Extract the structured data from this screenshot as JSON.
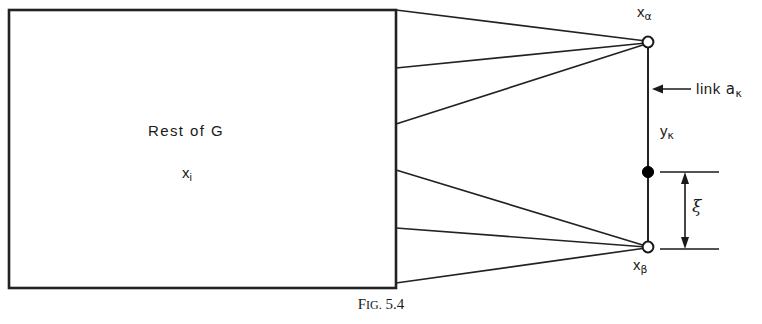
{
  "figure": {
    "caption_prefix": "F",
    "caption_small": "IG.",
    "caption_number": "5.4",
    "caption_full": "FIG. 5.4"
  },
  "box": {
    "label_main": "Rest of G",
    "label_node": "x",
    "label_node_sub": "i"
  },
  "nodes": [
    {
      "name": "x-alpha",
      "label_base": "x",
      "label_sub": "α",
      "style": "open-circle",
      "x": 648,
      "y": 42
    },
    {
      "name": "y-kappa",
      "label_base": "y",
      "label_sub": "κ",
      "style": "filled-circle",
      "x": 648,
      "y": 172
    },
    {
      "name": "x-beta",
      "label_base": "x",
      "label_sub": "β",
      "style": "open-circle",
      "x": 648,
      "y": 247
    }
  ],
  "annotations": {
    "link_label_text": "link ",
    "link_label_base": "a",
    "link_label_sub": "κ",
    "xi_symbol": "ξ"
  },
  "colors": {
    "ink": "#1a1a1a",
    "stroke": "#222222",
    "background": "#ffffff",
    "node_fill_open": "#ffffff",
    "node_fill_solid": "#000000"
  }
}
